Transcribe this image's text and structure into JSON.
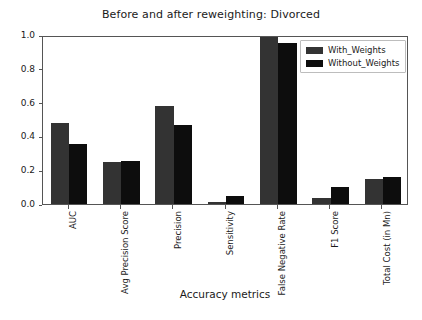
{
  "chart_data": {
    "type": "bar",
    "title": "Before and after reweighting: Divorced",
    "xlabel": "Accuracy metrics",
    "ylabel": "",
    "categories": [
      "AUC",
      "Avg Precision Score",
      "Precision",
      "Sensitivity",
      "False Negative Rate",
      "F1 Score",
      "Total Cost (in Mn)"
    ],
    "series": [
      {
        "name": "With_Weights",
        "color": "#333333",
        "values": [
          0.48,
          0.25,
          0.58,
          0.012,
          0.99,
          0.035,
          0.15
        ]
      },
      {
        "name": "Without_Weights",
        "color": "#0d0d0d",
        "values": [
          0.355,
          0.255,
          0.47,
          0.05,
          0.955,
          0.1,
          0.16
        ]
      }
    ],
    "ylim": [
      0.0,
      1.0
    ],
    "yticks": [
      "0.0",
      "0.2",
      "0.4",
      "0.6",
      "0.8",
      "1.0"
    ],
    "ytick_values": [
      0.0,
      0.2,
      0.4,
      0.6,
      0.8,
      1.0
    ],
    "grid": false,
    "legend_position": "upper right",
    "xtick_rotation": -90
  },
  "figure": {
    "background_color": "#ffffff",
    "axes_edge_color": "#555555"
  }
}
